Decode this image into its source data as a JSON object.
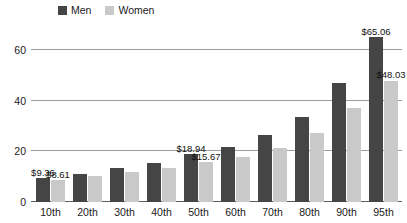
{
  "chart_data": {
    "type": "bar",
    "title": "",
    "xlabel": "",
    "ylabel": "",
    "ylim": [
      0,
      68
    ],
    "yticks": [
      0,
      20,
      40,
      60
    ],
    "ytick_labels": [
      "0",
      "20",
      "40",
      "60"
    ],
    "grid": true,
    "legend_position": "top-left",
    "categories": [
      "10th",
      "20th",
      "30th",
      "40th",
      "50th",
      "60th",
      "70th",
      "80th",
      "90th",
      "95th"
    ],
    "series": [
      {
        "name": "Men",
        "color": "#454545",
        "values": [
          9.36,
          11.2,
          13.3,
          15.4,
          18.94,
          21.6,
          26.3,
          33.6,
          47.2,
          65.06
        ],
        "labels": [
          "$9.36",
          "",
          "",
          "",
          "$18.94",
          "",
          "",
          "",
          "",
          "$65.06"
        ]
      },
      {
        "name": "Women",
        "color": "#c9c9c9",
        "values": [
          8.61,
          10.3,
          11.9,
          13.5,
          15.67,
          17.8,
          21.5,
          27.2,
          37.2,
          48.03
        ],
        "labels": [
          "$8.61",
          "",
          "",
          "",
          "$15.67",
          "",
          "",
          "",
          "",
          "$48.03"
        ]
      }
    ]
  }
}
